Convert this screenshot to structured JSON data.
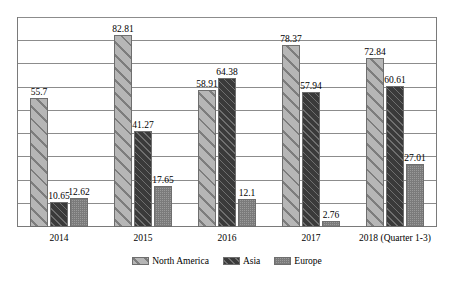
{
  "chart_data": {
    "type": "bar",
    "title": "",
    "subtitle": "",
    "xlabel": "",
    "ylabel": "",
    "ylim": [
      0,
      90
    ],
    "grid": true,
    "gridline_values": [
      0,
      10,
      20,
      30,
      40,
      50,
      60,
      70,
      80,
      90
    ],
    "legend_position": "bottom-center",
    "categories": [
      "2014",
      "2015",
      "2016",
      "2017",
      "2018 (Quarter 1-3)"
    ],
    "series": [
      {
        "name": "North America",
        "pattern": "light-gray-wide-diagonal-hatch",
        "color": "#b6b6b6",
        "values": [
          55.7,
          82.81,
          58.91,
          78.37,
          72.84
        ],
        "labels": [
          "55.7",
          "82.81",
          "58.91",
          "78.37",
          "72.84"
        ]
      },
      {
        "name": "Asia",
        "pattern": "dark-gray-fine-diagonal-hatch",
        "color": "#4a4a4a",
        "values": [
          10.65,
          41.27,
          64.38,
          57.94,
          60.61
        ],
        "labels": [
          "10.65",
          "41.27",
          "64.38",
          "57.94",
          "60.61"
        ]
      },
      {
        "name": "Europe",
        "pattern": "mid-gray-dotted-checker",
        "color": "#9a9a9a",
        "values": [
          12.62,
          17.65,
          12.1,
          2.76,
          27.01
        ],
        "labels": [
          "12.62",
          "17.65",
          "12.1",
          "2.76",
          "27.01"
        ]
      }
    ]
  },
  "legend": {
    "items": [
      {
        "label": "North America",
        "swatch": "na-swatch"
      },
      {
        "label": "Asia",
        "swatch": "as-swatch"
      },
      {
        "label": "Europe",
        "swatch": "eu-swatch"
      }
    ]
  }
}
